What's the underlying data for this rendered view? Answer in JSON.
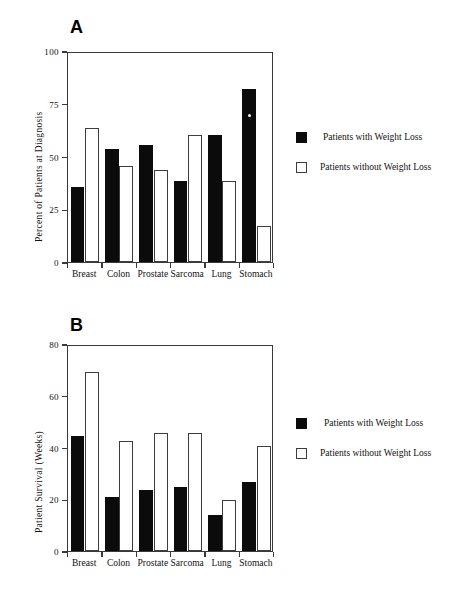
{
  "page": {
    "running_header": "",
    "background": "#ffffff",
    "ink": "#0b0b0b"
  },
  "colors": {
    "with_weight_loss": "#0b0b0b",
    "without_weight_loss": "#ffffff",
    "axis": "#3a3a3a"
  },
  "panels": [
    {
      "letter": "A",
      "ylabel": "Percent of Patients at Diagnosis",
      "yticks": [
        "0",
        "25",
        "50",
        "75",
        "100"
      ],
      "xticks": [
        "Breast",
        "Colon",
        "Prostate",
        "Sarcoma",
        "Lung",
        "Stomach"
      ],
      "legend": [
        {
          "label": "Patients with Weight Loss",
          "style": "filled"
        },
        {
          "label": "Patients without Weight Loss",
          "style": "hollow"
        }
      ]
    },
    {
      "letter": "B",
      "ylabel": "Patient Survival  (Weeks)",
      "yticks": [
        "0",
        "20",
        "40",
        "60",
        "80"
      ],
      "xticks": [
        "Breast",
        "Colon",
        "Prostate",
        "Sarcoma",
        "Lung",
        "Stomach"
      ],
      "legend": [
        {
          "label": "Patients with Weight Loss",
          "style": "filled"
        },
        {
          "label": "Patients without Weight Loss",
          "style": "hollow"
        }
      ]
    }
  ],
  "chart_data": [
    {
      "type": "bar",
      "panel": "A",
      "title": "A",
      "xlabel": "",
      "ylabel": "Percent of Patients at Diagnosis",
      "ylim": [
        0,
        100
      ],
      "yticks": [
        0,
        25,
        50,
        75,
        100
      ],
      "grid": false,
      "legend_position": "right",
      "categories": [
        "Breast",
        "Colon",
        "Prostate",
        "Sarcoma",
        "Lung",
        "Stomach"
      ],
      "series": [
        {
          "name": "Patients with Weight Loss",
          "values": [
            36,
            54,
            56,
            39,
            61,
            83
          ]
        },
        {
          "name": "Patients without Weight Loss",
          "values": [
            64,
            46,
            44,
            61,
            39,
            17
          ]
        }
      ]
    },
    {
      "type": "bar",
      "panel": "B",
      "title": "B",
      "xlabel": "",
      "ylabel": "Patient Survival (Weeks)",
      "ylim": [
        0,
        80
      ],
      "yticks": [
        0,
        20,
        40,
        60,
        80
      ],
      "grid": false,
      "legend_position": "right",
      "categories": [
        "Breast",
        "Colon",
        "Prostate",
        "Sarcoma",
        "Lung",
        "Stomach"
      ],
      "series": [
        {
          "name": "Patients with Weight Loss",
          "values": [
            45,
            21,
            24,
            25,
            14,
            27
          ]
        },
        {
          "name": "Patients without Weight Loss",
          "values": [
            70,
            43,
            46,
            46,
            20,
            41
          ]
        }
      ]
    }
  ]
}
